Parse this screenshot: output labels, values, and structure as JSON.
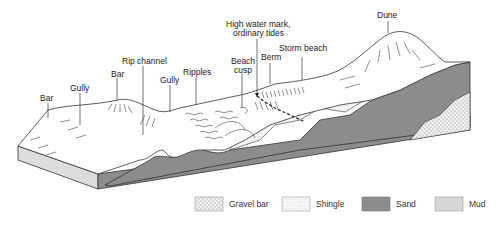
{
  "diagram": {
    "labels": [
      {
        "id": "bar-1",
        "text": "Bar"
      },
      {
        "id": "gully-1",
        "text": "Gully"
      },
      {
        "id": "bar-2",
        "text": "Bar"
      },
      {
        "id": "rip-channel",
        "text": "Rip channel"
      },
      {
        "id": "gully-2",
        "text": "Gully"
      },
      {
        "id": "ripples",
        "text": "Ripples"
      },
      {
        "id": "beach-cusp-line1",
        "text": "Beach"
      },
      {
        "id": "beach-cusp-line2",
        "text": "cusp"
      },
      {
        "id": "high-water-line1",
        "text": "High water mark,"
      },
      {
        "id": "high-water-line2",
        "text": "ordinary tides"
      },
      {
        "id": "berm",
        "text": "Berm"
      },
      {
        "id": "storm-beach",
        "text": "Storm beach"
      },
      {
        "id": "dune",
        "text": "Dune"
      }
    ]
  },
  "legend": {
    "items": [
      {
        "label": "Gravel bar",
        "fill": "#ececec",
        "pattern": "dots"
      },
      {
        "label": "Shingle",
        "fill": "#f4f4f4",
        "pattern": "stipple"
      },
      {
        "label": "Sand",
        "fill": "#8c8c8c",
        "pattern": "solid"
      },
      {
        "label": "Mud",
        "fill": "#d6d6d6",
        "pattern": "solid"
      }
    ]
  },
  "colors": {
    "sand": "#8c8c8c",
    "mud": "#d6d6d6",
    "shingle": "#f4f4f4",
    "gravel": "#ececec",
    "block_side": "#dcdcdc",
    "outline": "#333333"
  }
}
